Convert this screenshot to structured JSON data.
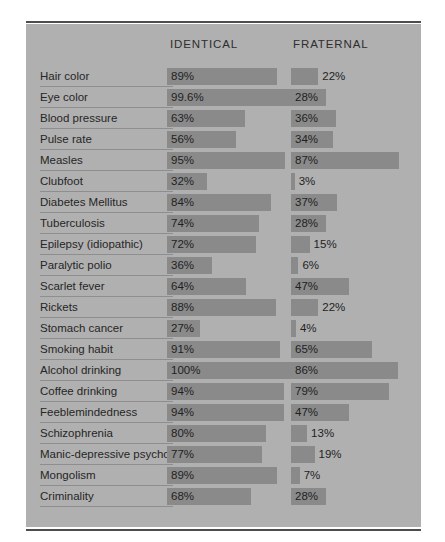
{
  "chart_data": {
    "type": "bar",
    "title": "",
    "orientation": "horizontal",
    "grid": false,
    "legend_position": "top",
    "xlabel": "",
    "ylabel": "",
    "xlim": [
      0,
      100
    ],
    "unit": "%",
    "categories": [
      "Hair color",
      "Eye color",
      "Blood pressure",
      "Pulse rate",
      "Measles",
      "Clubfoot",
      "Diabetes Mellitus",
      "Tuberculosis",
      "Epilepsy (idiopathic)",
      "Paralytic polio",
      "Scarlet fever",
      "Rickets",
      "Stomach cancer",
      "Smoking habit",
      "Alcohol drinking",
      "Coffee drinking",
      "Feeblemindedness",
      "Schizophrenia",
      "Manic-depressive psychosis",
      "Mongolism",
      "Criminality"
    ],
    "series": [
      {
        "name": "IDENTICAL",
        "values": [
          89,
          99.6,
          63,
          56,
          95,
          32,
          84,
          74,
          72,
          36,
          64,
          88,
          27,
          91,
          100,
          94,
          94,
          80,
          77,
          89,
          68
        ],
        "labels": [
          "89%",
          "99.6%",
          "63%",
          "56%",
          "95%",
          "32%",
          "84%",
          "74%",
          "72%",
          "36%",
          "64%",
          "88%",
          "27%",
          "91%",
          "100%",
          "94%",
          "94%",
          "80%",
          "77%",
          "89%",
          "68%"
        ]
      },
      {
        "name": "FRATERNAL",
        "values": [
          22,
          28,
          36,
          34,
          87,
          3,
          37,
          28,
          15,
          6,
          47,
          22,
          4,
          65,
          86,
          79,
          47,
          13,
          19,
          7,
          28
        ],
        "labels": [
          "22%",
          "28%",
          "36%",
          "34%",
          "87%",
          "3%",
          "37%",
          "28%",
          "15%",
          "6%",
          "47%",
          "22%",
          "4%",
          "65%",
          "86%",
          "79%",
          "47%",
          "13%",
          "19%",
          "7%",
          "28%"
        ]
      }
    ]
  },
  "header": {
    "identical_label": "IDENTICAL",
    "fraternal_label": "FRATERNAL"
  },
  "colors": {
    "page_background": "#ffffff",
    "panel_background": "#b0b0b0",
    "bar_fill": "#8a8a8a",
    "rule": "#4d4d4d",
    "underline": "#8e8e8e",
    "text": "#262626"
  }
}
